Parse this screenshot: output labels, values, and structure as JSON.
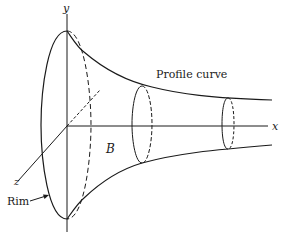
{
  "diagram": {
    "axes": {
      "x_label": "x",
      "y_label": "y",
      "z_label": "z"
    },
    "labels": {
      "profile_curve": "Profile curve",
      "region": "B",
      "rim": "Rim"
    },
    "colors": {
      "line": "#1a1a1a",
      "background": "#ffffff"
    }
  }
}
